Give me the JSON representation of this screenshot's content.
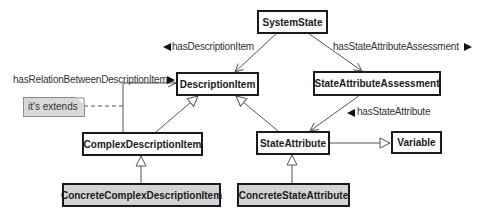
{
  "diagram": {
    "type": "uml-class-diagram",
    "classes": {
      "system_state": "SystemState",
      "description_item": "DescriptionItem",
      "state_attribute_assessment": "StateAttributeAssessment",
      "complex_description_item": "ComplexDescriptionItem",
      "state_attribute": "StateAttribute",
      "variable": "Variable",
      "concrete_complex_description_item": "ConcreteComplexDescriptionItem",
      "concrete_state_attribute": "ConcreteStateAttribute"
    },
    "associations": {
      "has_description_item": "hasDescriptionItem",
      "has_state_attribute_assessment": "hasStateAttributeAssessment",
      "has_relation_between_description_item": "hasRelationBetweenDescriptionItem",
      "has_state_attribute": "hasStateAttribute"
    },
    "note": {
      "text": "it's extends"
    },
    "relations": [
      {
        "from": "SystemState",
        "to": "DescriptionItem",
        "kind": "association",
        "label": "hasDescriptionItem"
      },
      {
        "from": "SystemState",
        "to": "StateAttributeAssessment",
        "kind": "association",
        "label": "hasStateAttributeAssessment"
      },
      {
        "from": "StateAttributeAssessment",
        "to": "StateAttribute",
        "kind": "association",
        "label": "hasStateAttribute"
      },
      {
        "from": "ComplexDescriptionItem",
        "to": "DescriptionItem",
        "kind": "association",
        "label": "hasRelationBetweenDescriptionItem"
      },
      {
        "from": "ComplexDescriptionItem",
        "to": "DescriptionItem",
        "kind": "generalization"
      },
      {
        "from": "StateAttribute",
        "to": "DescriptionItem",
        "kind": "generalization"
      },
      {
        "from": "StateAttribute",
        "to": "Variable",
        "kind": "generalization"
      },
      {
        "from": "ConcreteComplexDescriptionItem",
        "to": "ComplexDescriptionItem",
        "kind": "generalization"
      },
      {
        "from": "ConcreteStateAttribute",
        "to": "StateAttribute",
        "kind": "generalization"
      }
    ],
    "colors": {
      "line": "#555555",
      "border": "#1a1a1a",
      "concrete_fill": "#d4d4d4",
      "note_fill": "#d9d9d9"
    }
  }
}
